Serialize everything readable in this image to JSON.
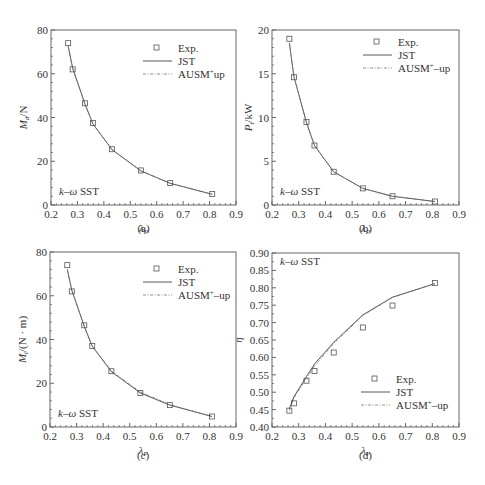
{
  "chart_data": [
    {
      "panel": "(a)",
      "type": "line",
      "title": "",
      "xlabel": "λP",
      "ylabel": "Md/N",
      "xlim": [
        0.2,
        0.9
      ],
      "ylim": [
        0,
        80
      ],
      "xticks": [
        0.2,
        0.3,
        0.4,
        0.5,
        0.6,
        0.7,
        0.8,
        0.9
      ],
      "yticks": [
        0,
        20,
        40,
        60,
        80
      ],
      "annotation": "k–ω SST",
      "legend_position": "upper right",
      "x": [
        0.265,
        0.282,
        0.329,
        0.359,
        0.431,
        0.54,
        0.651,
        0.81
      ],
      "series": [
        {
          "name": "Exp.",
          "style": "square-marker",
          "values": [
            74,
            62,
            46.5,
            37.5,
            25.5,
            15.8,
            10,
            5
          ]
        },
        {
          "name": "JST",
          "style": "solid",
          "values": [
            72.5,
            62.5,
            46,
            37,
            25.3,
            15.6,
            9.9,
            4.9
          ]
        },
        {
          "name": "AUSM⁺up",
          "style": "dash-dot",
          "values": [
            72.5,
            62.5,
            46,
            37,
            25.3,
            15.6,
            9.9,
            4.9
          ]
        }
      ]
    },
    {
      "panel": "(b)",
      "type": "line",
      "title": "",
      "xlabel": "λP",
      "ylabel": "Pt/kW",
      "xlim": [
        0.2,
        0.9
      ],
      "ylim": [
        0,
        20
      ],
      "xticks": [
        0.2,
        0.3,
        0.4,
        0.5,
        0.6,
        0.7,
        0.8,
        0.9
      ],
      "yticks": [
        0,
        5,
        10,
        15,
        20
      ],
      "annotation": "k–ω SST",
      "legend_position": "upper right",
      "x": [
        0.265,
        0.282,
        0.329,
        0.359,
        0.431,
        0.54,
        0.651,
        0.81
      ],
      "series": [
        {
          "name": "Exp.",
          "style": "square-marker",
          "values": [
            19.0,
            14.6,
            9.5,
            6.8,
            3.8,
            1.9,
            1.0,
            0.4
          ]
        },
        {
          "name": "JST",
          "style": "solid",
          "values": [
            18.5,
            14.7,
            9.4,
            6.8,
            3.8,
            1.9,
            1.0,
            0.4
          ]
        },
        {
          "name": "AUSM⁺–up",
          "style": "dash-dot",
          "values": [
            18.5,
            14.7,
            9.4,
            6.8,
            3.8,
            1.9,
            1.0,
            0.4
          ]
        }
      ]
    },
    {
      "panel": "(c)",
      "type": "line",
      "title": "",
      "xlabel": "λP",
      "ylabel": "Mt/(N · m)",
      "xlim": [
        0.2,
        0.9
      ],
      "ylim": [
        0,
        80
      ],
      "xticks": [
        0.2,
        0.3,
        0.4,
        0.5,
        0.6,
        0.7,
        0.8,
        0.9
      ],
      "yticks": [
        0,
        20,
        40,
        60,
        80
      ],
      "annotation": "k–ω SST",
      "legend_position": "upper right",
      "x": [
        0.265,
        0.282,
        0.329,
        0.359,
        0.431,
        0.54,
        0.651,
        0.81
      ],
      "series": [
        {
          "name": "Exp.",
          "style": "square-marker",
          "values": [
            74,
            62,
            46.5,
            37,
            25.5,
            15.5,
            10,
            4.8
          ]
        },
        {
          "name": "JST",
          "style": "solid",
          "values": [
            72,
            62.5,
            46,
            37,
            25.3,
            15.6,
            10,
            4.8
          ]
        },
        {
          "name": "AUSM⁺–up",
          "style": "dash-dot",
          "values": [
            72,
            62.5,
            46,
            37,
            25.6,
            16,
            10.3,
            4.8
          ]
        }
      ]
    },
    {
      "panel": "(d)",
      "type": "line",
      "title": "",
      "xlabel": "λP",
      "ylabel": "η",
      "xlim": [
        0.2,
        0.9
      ],
      "ylim": [
        0.4,
        0.9
      ],
      "xticks": [
        0.2,
        0.3,
        0.4,
        0.5,
        0.6,
        0.7,
        0.8,
        0.9
      ],
      "yticks": [
        0.4,
        0.45,
        0.5,
        0.55,
        0.6,
        0.65,
        0.7,
        0.75,
        0.8,
        0.85,
        0.9
      ],
      "annotation": "k–ω SST",
      "legend_position": "lower right",
      "x": [
        0.265,
        0.282,
        0.329,
        0.359,
        0.431,
        0.54,
        0.651,
        0.81
      ],
      "series": [
        {
          "name": "Exp.",
          "style": "square-marker",
          "values": [
            0.447,
            0.468,
            0.533,
            0.561,
            0.614,
            0.686,
            0.749,
            0.814
          ]
        },
        {
          "name": "JST",
          "style": "solid",
          "values": [
            0.452,
            0.487,
            0.545,
            0.581,
            0.643,
            0.722,
            0.773,
            0.812
          ]
        },
        {
          "name": "AUSM⁺–up",
          "style": "dash-dot",
          "values": [
            0.447,
            0.483,
            0.54,
            0.575,
            0.64,
            0.72,
            0.772,
            0.812
          ]
        }
      ]
    }
  ],
  "captions": [
    "(a)",
    "(b)",
    "(c)",
    "(d)"
  ],
  "axis_labels": {
    "a_y": "M",
    "a_y_sub": "d",
    "a_y_unit": "/N",
    "b_y": "P",
    "b_y_sub": "t",
    "b_y_unit": "/kW",
    "c_y": "M",
    "c_y_sub": "t",
    "c_y_unit": "/(N · m)",
    "d_y": "η",
    "x": "λ",
    "x_sub": "P"
  },
  "annotation": "k–ω SST",
  "legends": {
    "a": [
      "Exp.",
      "JST",
      "AUSM⁺up"
    ],
    "b": [
      "Exp.",
      "JST",
      "AUSM⁺–up"
    ],
    "c": [
      "Exp.",
      "JST",
      "AUSM⁺–up"
    ],
    "d": [
      "Exp.",
      "JST",
      "AUSM⁺–up"
    ]
  }
}
